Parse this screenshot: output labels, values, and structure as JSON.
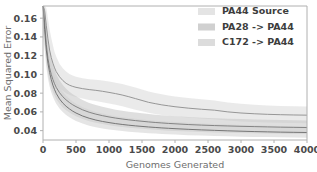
{
  "chart_data": {
    "type": "line",
    "title": "",
    "xlabel": "Genomes Generated",
    "ylabel": "Mean Squared Error",
    "xlim": [
      0,
      4000
    ],
    "ylim": [
      0.03,
      0.173
    ],
    "grid": false,
    "legend_position": "upper right",
    "xticks": [
      0,
      500,
      1000,
      1500,
      2000,
      2500,
      3000,
      3500,
      4000
    ],
    "xtick_labels": [
      "0",
      "500",
      "1000",
      "1500",
      "2000",
      "2500",
      "3000",
      "3500",
      "4000"
    ],
    "yticks": [
      0.04,
      0.06,
      0.08,
      0.1,
      0.12,
      0.14,
      0.16
    ],
    "ytick_labels": [
      "0.04",
      "0.06",
      "0.08",
      "0.10",
      "0.12",
      "0.14",
      "0.16"
    ],
    "x": [
      0,
      25,
      50,
      75,
      100,
      125,
      150,
      175,
      200,
      250,
      300,
      350,
      400,
      450,
      500,
      600,
      700,
      800,
      900,
      1000,
      1100,
      1200,
      1300,
      1400,
      1500,
      1600,
      1700,
      1800,
      1900,
      2000,
      2200,
      2400,
      2600,
      2800,
      3000,
      3200,
      3400,
      3600,
      3800,
      4000
    ],
    "series": [
      {
        "name": "PA44 Source",
        "color": "#8c8c8c",
        "band_color": "#d9d9d9",
        "values": [
          0.173,
          0.168,
          0.152,
          0.138,
          0.126,
          0.118,
          0.112,
          0.107,
          0.103,
          0.0975,
          0.0935,
          0.0905,
          0.0885,
          0.0872,
          0.0862,
          0.0848,
          0.0838,
          0.083,
          0.082,
          0.0808,
          0.0795,
          0.078,
          0.0762,
          0.0742,
          0.0722,
          0.0702,
          0.0688,
          0.0675,
          0.0665,
          0.0655,
          0.064,
          0.0628,
          0.0618,
          0.06,
          0.0588,
          0.058,
          0.0574,
          0.057,
          0.0567,
          0.0565
        ],
        "band_lower": [
          0.16,
          0.15,
          0.132,
          0.118,
          0.108,
          0.101,
          0.096,
          0.092,
          0.0895,
          0.0855,
          0.0825,
          0.08,
          0.0782,
          0.077,
          0.076,
          0.0742,
          0.0728,
          0.0716,
          0.0704,
          0.069,
          0.0676,
          0.066,
          0.0642,
          0.0624,
          0.0606,
          0.059,
          0.0578,
          0.0568,
          0.056,
          0.0552,
          0.054,
          0.053,
          0.0522,
          0.0508,
          0.0498,
          0.0492,
          0.0487,
          0.0484,
          0.0482,
          0.048
        ],
        "band_upper": [
          0.173,
          0.173,
          0.171,
          0.16,
          0.148,
          0.139,
          0.131,
          0.124,
          0.119,
          0.1115,
          0.1065,
          0.103,
          0.1005,
          0.0988,
          0.0975,
          0.0958,
          0.0948,
          0.0942,
          0.0934,
          0.0924,
          0.0912,
          0.0898,
          0.088,
          0.086,
          0.084,
          0.0818,
          0.0802,
          0.0788,
          0.0776,
          0.0765,
          0.0748,
          0.0734,
          0.0722,
          0.07,
          0.0686,
          0.0676,
          0.0669,
          0.0664,
          0.066,
          0.0658
        ]
      },
      {
        "name": "PA28 -> PA44",
        "color": "#7a7a7a",
        "band_color": "#c4c4c4",
        "values": [
          0.173,
          0.155,
          0.132,
          0.117,
          0.107,
          0.1,
          0.0945,
          0.09,
          0.0862,
          0.0805,
          0.0762,
          0.0728,
          0.07,
          0.0676,
          0.0656,
          0.0622,
          0.0596,
          0.0576,
          0.056,
          0.0546,
          0.0534,
          0.0524,
          0.0515,
          0.0507,
          0.05,
          0.0493,
          0.0487,
          0.0482,
          0.0477,
          0.0473,
          0.0465,
          0.0459,
          0.0454,
          0.045,
          0.0446,
          0.0443,
          0.044,
          0.0437,
          0.0435,
          0.0433
        ],
        "band_lower": [
          0.15,
          0.134,
          0.114,
          0.101,
          0.0925,
          0.0862,
          0.0812,
          0.0772,
          0.0738,
          0.0686,
          0.0648,
          0.0618,
          0.0593,
          0.0572,
          0.0554,
          0.0524,
          0.0501,
          0.0484,
          0.047,
          0.0458,
          0.0448,
          0.044,
          0.0432,
          0.0425,
          0.0419,
          0.0414,
          0.0409,
          0.0404,
          0.04,
          0.0397,
          0.039,
          0.0385,
          0.0381,
          0.0377,
          0.0374,
          0.0371,
          0.0369,
          0.0367,
          0.0365,
          0.0363
        ],
        "band_upper": [
          0.173,
          0.173,
          0.155,
          0.137,
          0.125,
          0.117,
          0.11,
          0.105,
          0.1005,
          0.0938,
          0.0888,
          0.0848,
          0.0816,
          0.0789,
          0.0766,
          0.0727,
          0.0696,
          0.0673,
          0.0654,
          0.0638,
          0.0624,
          0.0612,
          0.0602,
          0.0593,
          0.0585,
          0.0577,
          0.057,
          0.0564,
          0.0559,
          0.0554,
          0.0545,
          0.0538,
          0.0532,
          0.0527,
          0.0523,
          0.0519,
          0.0516,
          0.0513,
          0.051,
          0.0508
        ]
      },
      {
        "name": "C172 -> PA44",
        "color": "#6b6b6b",
        "band_color": "#cfcfcf",
        "values": [
          0.173,
          0.148,
          0.126,
          0.112,
          0.102,
          0.0945,
          0.0885,
          0.0838,
          0.0798,
          0.0738,
          0.0694,
          0.066,
          0.0632,
          0.0608,
          0.0588,
          0.0556,
          0.0532,
          0.0513,
          0.0498,
          0.0486,
          0.0475,
          0.0466,
          0.0458,
          0.0451,
          0.0445,
          0.0439,
          0.0434,
          0.0429,
          0.0425,
          0.0421,
          0.0414,
          0.0408,
          0.0403,
          0.0398,
          0.0394,
          0.039,
          0.0387,
          0.0384,
          0.0382,
          0.038
        ],
        "band_lower": [
          0.142,
          0.126,
          0.108,
          0.0955,
          0.0872,
          0.081,
          0.0762,
          0.0722,
          0.0688,
          0.0636,
          0.0598,
          0.0568,
          0.0543,
          0.0522,
          0.0504,
          0.0475,
          0.0453,
          0.0437,
          0.0424,
          0.0413,
          0.0404,
          0.0396,
          0.0389,
          0.0383,
          0.0378,
          0.0373,
          0.0369,
          0.0365,
          0.0361,
          0.0358,
          0.0352,
          0.0347,
          0.0343,
          0.0339,
          0.0336,
          0.0333,
          0.0331,
          0.0329,
          0.0327,
          0.0325
        ],
        "band_upper": [
          0.173,
          0.17,
          0.148,
          0.131,
          0.119,
          0.11,
          0.103,
          0.0977,
          0.093,
          0.0862,
          0.0812,
          0.0772,
          0.074,
          0.0712,
          0.0688,
          0.065,
          0.0622,
          0.06,
          0.0582,
          0.0567,
          0.0554,
          0.0543,
          0.0534,
          0.0526,
          0.0519,
          0.0512,
          0.0506,
          0.0501,
          0.0496,
          0.0492,
          0.0484,
          0.0477,
          0.0471,
          0.0466,
          0.0461,
          0.0457,
          0.0453,
          0.045,
          0.0447,
          0.0445
        ]
      }
    ]
  },
  "legend": {
    "items": [
      {
        "label": "PA44 Source",
        "swatch_color": "#e4e4e4"
      },
      {
        "label": "PA28 -> PA44",
        "swatch_color": "#d0d0d0"
      },
      {
        "label": "C172 -> PA44",
        "swatch_color": "#dcdcdc"
      }
    ]
  },
  "axes": {
    "xlabel": "Genomes Generated",
    "ylabel": "Mean Squared Error"
  },
  "colors": {
    "spine": "#b0b0b0",
    "tick_label": "#4a4a4a",
    "axis_label": "#6e6e6e",
    "legend_label": "#3d3d3d",
    "background": "#ffffff"
  }
}
